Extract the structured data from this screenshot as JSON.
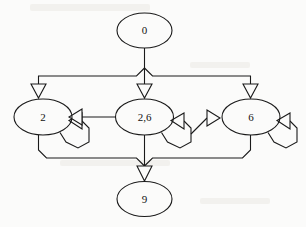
{
  "diagram": {
    "background_color": "#fbfbfa",
    "stroke_color": "#1a1a1a",
    "nodes": [
      {
        "id": "n0",
        "label": "0",
        "cx": 144.5,
        "cy": 30.5,
        "rx": 27.5,
        "ry": 17.5
      },
      {
        "id": "n2",
        "label": "2",
        "cx": 43.0,
        "cy": 117.0,
        "rx": 29.0,
        "ry": 18.0
      },
      {
        "id": "n26",
        "label": "2,6",
        "cx": 144.5,
        "cy": 117.0,
        "rx": 29.0,
        "ry": 18.0
      },
      {
        "id": "n6",
        "label": "6",
        "cx": 251.0,
        "cy": 117.0,
        "rx": 29.0,
        "ry": 18.0
      },
      {
        "id": "n9",
        "label": "9",
        "cx": 144.5,
        "cy": 199.0,
        "rx": 27.5,
        "ry": 17.5
      }
    ],
    "edges": [
      {
        "id": "e0-2",
        "from": "0",
        "to": "2",
        "kind": "fan-out"
      },
      {
        "id": "e0-26",
        "from": "0",
        "to": "2,6",
        "kind": "fan-out"
      },
      {
        "id": "e0-6",
        "from": "0",
        "to": "6",
        "kind": "fan-out"
      },
      {
        "id": "e26-2",
        "from": "2,6",
        "to": "2",
        "kind": "horizontal"
      },
      {
        "id": "e26-6",
        "from": "2,6",
        "to": "6",
        "kind": "horizontal"
      },
      {
        "id": "e2-2",
        "from": "2",
        "to": "2",
        "kind": "self-loop"
      },
      {
        "id": "e26-26",
        "from": "2,6",
        "to": "2,6",
        "kind": "self-loop"
      },
      {
        "id": "e6-6",
        "from": "6",
        "to": "6",
        "kind": "self-loop"
      },
      {
        "id": "e2-9",
        "from": "2",
        "to": "9",
        "kind": "fan-in"
      },
      {
        "id": "e26-9",
        "from": "2,6",
        "to": "9",
        "kind": "fan-in"
      },
      {
        "id": "e6-9",
        "from": "6",
        "to": "9",
        "kind": "fan-in"
      }
    ]
  }
}
